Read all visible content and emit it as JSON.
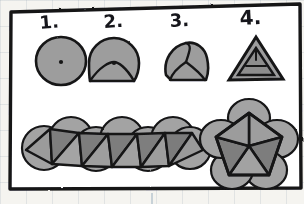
{
  "figure": {
    "medium": "pencil sketch on faint grid paper",
    "panel_border_color": "#1a1a1a",
    "panel_fill_color": "#ffffff",
    "background_color": "#f5f4f0",
    "grid_line_color": "#8fa4b5"
  },
  "palette": {
    "ink": "#151518",
    "circle_fill": "#9d9d9d",
    "triangle_fill_dark": "#7e7e7e",
    "triangle_fill_mid": "#8d8d8d",
    "triangle_fill_light": "#a6a6a6",
    "white": "#ffffff"
  },
  "steps": [
    {
      "id": "step-1",
      "label": "1.",
      "name": "circle-with-center-dot",
      "description": "A plain circle with a marked center point.",
      "has_center_dot": true,
      "segments": 1
    },
    {
      "id": "step-2",
      "label": "2.",
      "name": "circle-one-fold",
      "description": "Circle with a single chord/arc folded up toward the center dot.",
      "has_center_dot": true,
      "segments": 2
    },
    {
      "id": "step-3",
      "label": "3.",
      "name": "circle-three-folds",
      "description": "Circle with three arcs folded in, meeting at the center, forming a rounded triangle.",
      "has_center_dot": false,
      "segments": 3
    },
    {
      "id": "step-4",
      "label": "4.",
      "name": "equilateral-triangle",
      "description": "Fully folded result: an equilateral triangle with the inner folded triangle visible.",
      "has_center_dot": false,
      "segments": 3
    }
  ],
  "assemblies": [
    {
      "id": "assembly-strip",
      "name": "triangle-strip-antiprism-net",
      "description": "A horizontal strip of seven overlapping circles folded into a zig-zag band of triangles.",
      "circle_count": 7,
      "triangle_count": 11
    },
    {
      "id": "assembly-pentagon",
      "name": "pentagonal-rosette",
      "description": "Five overlapping circles arranged in a ring, folded into a pentagon of five triangles meeting at the center.",
      "circle_count": 5,
      "triangle_count": 5
    }
  ],
  "annotations": {
    "grid_tick_below_panel": "|"
  }
}
